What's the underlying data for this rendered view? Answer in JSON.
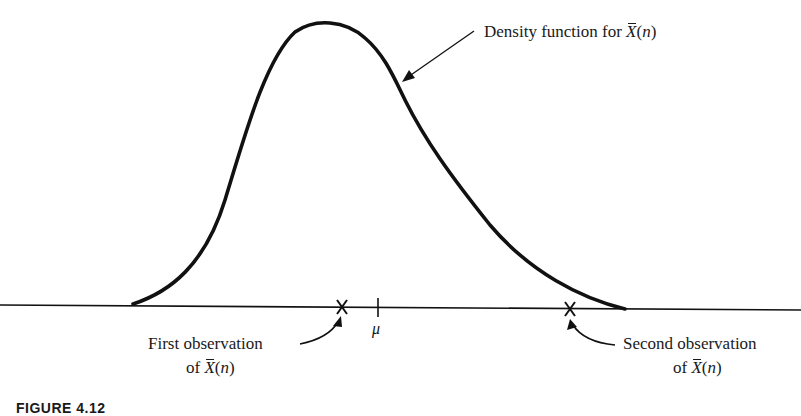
{
  "figure": {
    "caption": "FIGURE 4.12",
    "density_label": {
      "prefix": "Density function for ",
      "symbol": "X",
      "suffix_open": "(",
      "arg": "n",
      "suffix_close": ")"
    },
    "first_observation": {
      "line1": "First observation",
      "prefix": "of ",
      "symbol": "X",
      "open": "(",
      "arg": "n",
      "close": ")"
    },
    "second_observation": {
      "line1": "Second observation",
      "prefix": "of ",
      "symbol": "X",
      "open": "(",
      "arg": "n",
      "close": ")"
    },
    "mean_label": "μ",
    "observation_marker": "X"
  }
}
